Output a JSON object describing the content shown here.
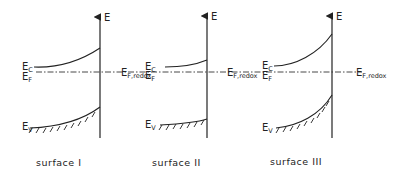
{
  "diagram": {
    "axis_label": "E",
    "panels": [
      {
        "id": "I",
        "caption": "surface  I",
        "ec_label": "E",
        "ec_sub": "C",
        "ef_label": "E",
        "ef_sub": "F",
        "ev_label": "E",
        "ev_sub": "V",
        "redox_label": "E",
        "redox_sub": "F,redox",
        "band_bending": "upward (depletion)"
      },
      {
        "id": "II",
        "caption": "surface II",
        "ec_label": "E",
        "ec_sub": "C",
        "ef_label": "E",
        "ef_sub": "F",
        "ev_label": "E",
        "ev_sub": "V",
        "redox_label": "E",
        "redox_sub": "F,redox",
        "band_bending": "slight upward"
      },
      {
        "id": "III",
        "caption": "surface III",
        "ec_label": "E",
        "ec_sub": "C",
        "ef_label": "E",
        "ef_sub": "F",
        "ev_label": "E",
        "ev_sub": "V",
        "redox_label": "E",
        "redox_sub": "F,redox",
        "band_bending": "strong upward (inversion)"
      }
    ]
  }
}
